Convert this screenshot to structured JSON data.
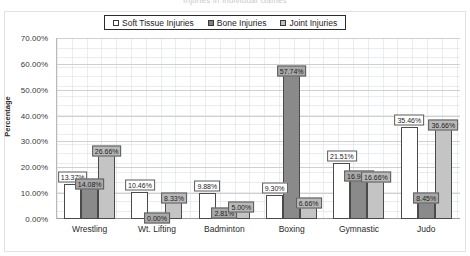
{
  "chart_data": {
    "type": "bar",
    "title": "Injuries in Individual Games",
    "categories": [
      "Wrestling",
      "Wt. Lifting",
      "Badminton",
      "Boxing",
      "Gymnastic",
      "Judo"
    ],
    "series": [
      {
        "name": "Soft Tissue Injuries",
        "color": "#ffffff",
        "values": [
          13.37,
          10.46,
          9.88,
          9.3,
          21.51,
          35.46
        ],
        "labels": [
          "13.37%",
          "10.46%",
          "9.88%",
          "9.30%",
          "21.51%",
          "35.46%"
        ]
      },
      {
        "name": "Bone Injuries",
        "color": "#808080",
        "values": [
          14.08,
          0.0,
          2.81,
          57.74,
          16.9,
          8.45
        ],
        "labels": [
          "14.08%",
          "0.00%",
          "2.81%",
          "57.74%",
          "16.90%",
          "8.45%"
        ]
      },
      {
        "name": "Joint Injuries",
        "color": "#bfbfbf",
        "values": [
          26.66,
          8.33,
          5.0,
          6.66,
          16.66,
          36.66
        ],
        "labels": [
          "26.66%",
          "8.33%",
          "5.00%",
          "6.66%",
          "16.66%",
          "36.66%"
        ]
      }
    ],
    "xlabel": "",
    "ylabel": "Percentage",
    "ylim": [
      0,
      70
    ],
    "ytick_labels": [
      "70.00%",
      "60.00%",
      "50.00%",
      "40.00%",
      "30.00%",
      "20.00%",
      "10.00%",
      "0.00%"
    ],
    "ytick_values": [
      70,
      60,
      50,
      40,
      30,
      20,
      10,
      0
    ],
    "grid": true,
    "legend_position": "top-center"
  }
}
